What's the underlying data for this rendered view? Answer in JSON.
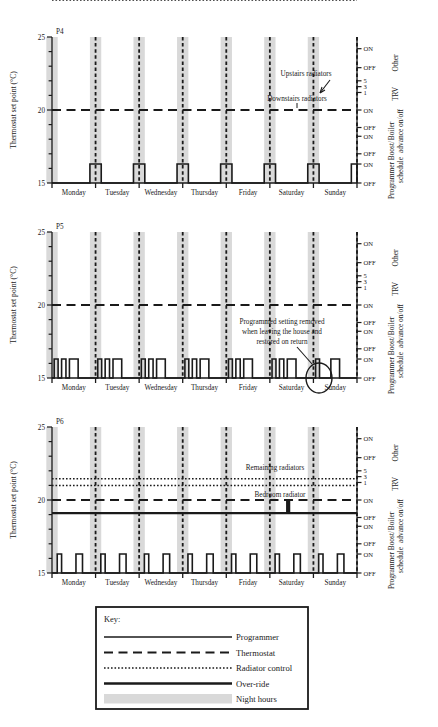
{
  "figure": {
    "title": "",
    "panels": [
      {
        "id": "P4",
        "label": "P4",
        "y_axis_label": "Thermostat set point (°C)",
        "y_ticks": [
          "25",
          "20",
          "15"
        ],
        "annotations": [
          {
            "name": "upstairs-radiators",
            "text": "Upstairs radiators"
          },
          {
            "name": "downstairs-radiators",
            "text": "Downstairs radiators"
          }
        ]
      },
      {
        "id": "P5",
        "label": "P5",
        "y_axis_label": "Thermostat set point (°C)",
        "y_ticks": [
          "25",
          "20",
          "15"
        ],
        "annotations": [
          {
            "name": "programmed-setting-note",
            "line1": "Programmed setting removed",
            "line2": "when leaving the house and",
            "line3": "restored on return"
          }
        ]
      },
      {
        "id": "P6",
        "label": "P6",
        "y_axis_label": "Thermostat set point (°C)",
        "y_ticks": [
          "25",
          "20",
          "15"
        ],
        "annotations": [
          {
            "name": "remaining-radiators",
            "text": "Remaining radiators"
          },
          {
            "name": "bedroom-radiator",
            "text": "Bedroom radiator"
          }
        ]
      }
    ],
    "days": [
      "Monday",
      "Tuesday",
      "Wednesday",
      "Thursday",
      "Friday",
      "Saturday",
      "Sunday"
    ],
    "right_axis": {
      "tick_labels": [
        "ON",
        "OFF",
        "5",
        "3",
        "1",
        "ON",
        "OFF",
        "ON",
        "OFF",
        "ON",
        "OFF"
      ],
      "groups": [
        {
          "name": "other",
          "label": "Other"
        },
        {
          "name": "trv",
          "label": "TRV"
        },
        {
          "name": "boiler",
          "label": "Boiler",
          "label2": "advance on/off"
        },
        {
          "name": "programmer",
          "label": "Programmer",
          "label2": "Boost/",
          "label3": "schedule"
        }
      ]
    },
    "key": {
      "title": "Key:",
      "items": [
        {
          "name": "programmer",
          "label": "Programmer",
          "style": "solid-thin"
        },
        {
          "name": "thermostat",
          "label": "Thermostat",
          "style": "dashed"
        },
        {
          "name": "radiator-control",
          "label": "Radiator control",
          "style": "dotted"
        },
        {
          "name": "over-ride",
          "label": "Over-ride",
          "style": "solid-thick"
        },
        {
          "name": "night-hours",
          "label": "Night hours",
          "style": "band"
        }
      ]
    },
    "colors": {
      "line": "#1a1a1a",
      "night_band": "#d9d9d9",
      "background": "#ffffff"
    }
  },
  "chart_data": {
    "type": "line",
    "xlabel": "",
    "ylabel": "Thermostat set point (°C)",
    "ylim": [
      15,
      25
    ],
    "yticks": [
      15,
      16,
      17,
      18,
      19,
      20,
      21,
      22,
      23,
      24,
      25
    ],
    "ytick_labels_shown": [
      25,
      20,
      15
    ],
    "x_categories": [
      "Monday",
      "Tuesday",
      "Wednesday",
      "Thursday",
      "Friday",
      "Saturday",
      "Sunday"
    ],
    "xlim": [
      0,
      7
    ],
    "grid": false,
    "legend_position": "below-figure",
    "legend_entries": [
      "Programmer",
      "Thermostat",
      "Radiator control",
      "Over-ride",
      "Night hours"
    ],
    "night_hours_bands": [
      {
        "start": -0.13,
        "end": 0.13
      },
      {
        "start": 0.87,
        "end": 1.13
      },
      {
        "start": 1.87,
        "end": 2.13
      },
      {
        "start": 2.87,
        "end": 3.13
      },
      {
        "start": 3.87,
        "end": 4.13
      },
      {
        "start": 4.87,
        "end": 5.13
      },
      {
        "start": 5.87,
        "end": 6.13
      }
    ],
    "panels": [
      {
        "id": "P4",
        "series": [
          {
            "name": "Thermostat",
            "style": "dashed",
            "constant_value": 20.0,
            "x": [
              0,
              7
            ],
            "values": [
              20.0,
              20.0
            ]
          },
          {
            "name": "Radiator control (Upstairs radiators)",
            "style": "dotted",
            "note": "Two raised steps per day between 21.1 and 22.0",
            "baseline": 21.1,
            "peak": 22.0,
            "steps_per_day": [
              {
                "start": 0.0,
                "end": 0.2
              },
              {
                "start": 0.55,
                "end": 0.78
              }
            ]
          },
          {
            "name": "Programmer",
            "style": "solid-thin",
            "baseline": 15.0,
            "peak": 16.3,
            "pulses_per_day": [
              {
                "start": 0.87,
                "end": 1.13
              }
            ]
          }
        ],
        "annotations": [
          {
            "text": "Upstairs radiators",
            "points_to": "radiator-control-step"
          },
          {
            "text": "Downstairs radiators",
            "points_to": "thermostat-line"
          }
        ]
      },
      {
        "id": "P5",
        "series": [
          {
            "name": "Thermostat",
            "style": "dashed",
            "constant_value": 20.0,
            "x": [
              0,
              7
            ],
            "values": [
              20.0,
              20.0
            ]
          },
          {
            "name": "Programmer",
            "style": "solid-thin",
            "baseline": 15.0,
            "peak": 16.3,
            "pulses_per_day": [
              {
                "start": 0.05,
                "end": 0.14
              },
              {
                "start": 0.22,
                "end": 0.32
              },
              {
                "start": 0.4,
                "end": 0.6
              }
            ],
            "sunday_exception": "one pulse removed (circled)"
          }
        ],
        "annotations": [
          {
            "text": "Programmed setting removed when leaving the house and restored on return",
            "points_to": "sunday-gap-ellipse"
          }
        ]
      },
      {
        "id": "P6",
        "series": [
          {
            "name": "Radiator control (Remaining radiators)",
            "style": "dotted",
            "constant_value": 21.45,
            "x": [
              0,
              7
            ],
            "values": [
              21.45,
              21.45
            ]
          },
          {
            "name": "Radiator control (lower)",
            "style": "dotted",
            "constant_value": 21.0,
            "x": [
              0,
              7
            ],
            "values": [
              21.0,
              21.0
            ]
          },
          {
            "name": "Thermostat",
            "style": "dashed",
            "constant_value": 20.0,
            "x": [
              0,
              7
            ],
            "values": [
              20.0,
              20.0
            ]
          },
          {
            "name": "Over-ride",
            "style": "solid-thick",
            "constant_value": 19.1,
            "x": [
              0,
              7
            ],
            "values": [
              19.1,
              19.1
            ]
          },
          {
            "name": "Bedroom radiator (over-ride spike)",
            "style": "solid-thick-vertical",
            "x": 5.42,
            "from": 19.1,
            "to": 20.0
          },
          {
            "name": "Programmer",
            "style": "solid-thin",
            "baseline": 15.0,
            "peak": 16.3,
            "pulses_per_day": [
              {
                "start": 0.12,
                "end": 0.22
              },
              {
                "start": 0.55,
                "end": 0.7
              }
            ]
          }
        ],
        "annotations": [
          {
            "text": "Remaining radiators",
            "points_to": "dotted-line-upper"
          },
          {
            "text": "Bedroom radiator",
            "points_to": "vertical-spike"
          }
        ]
      }
    ]
  }
}
